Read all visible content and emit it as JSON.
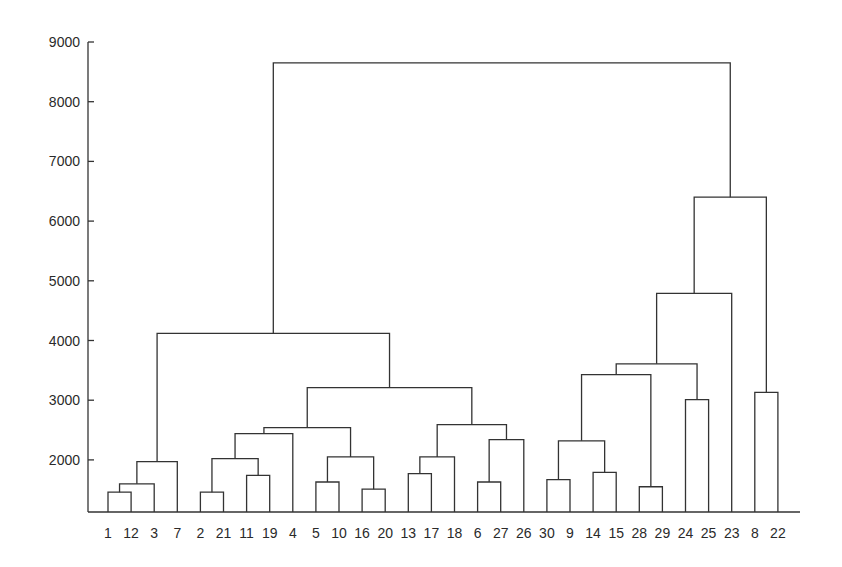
{
  "chart_data": {
    "type": "dendrogram",
    "title": "",
    "xlabel": "",
    "ylabel": "",
    "ylim": [
      1110,
      9000
    ],
    "y_ticks": [
      2000,
      3000,
      4000,
      5000,
      6000,
      7000,
      8000,
      9000
    ],
    "grid": false,
    "leaf_order": [
      "1",
      "12",
      "3",
      "7",
      "2",
      "21",
      "11",
      "19",
      "4",
      "5",
      "10",
      "16",
      "20",
      "13",
      "17",
      "18",
      "6",
      "27",
      "26",
      "30",
      "9",
      "14",
      "15",
      "28",
      "29",
      "24",
      "25",
      "23",
      "8",
      "22"
    ],
    "merges": [
      {
        "id": "A",
        "left": "1",
        "right": "12",
        "height": 1460
      },
      {
        "id": "B",
        "left": "A",
        "right": "3",
        "height": 1600
      },
      {
        "id": "C",
        "left": "B",
        "right": "7",
        "height": 1970
      },
      {
        "id": "D",
        "left": "2",
        "right": "21",
        "height": 1460
      },
      {
        "id": "E",
        "left": "11",
        "right": "19",
        "height": 1740
      },
      {
        "id": "F",
        "left": "D",
        "right": "E",
        "height": 2020
      },
      {
        "id": "G",
        "left": "F",
        "right": "4",
        "height": 2440
      },
      {
        "id": "H",
        "left": "5",
        "right": "10",
        "height": 1630
      },
      {
        "id": "I",
        "left": "16",
        "right": "20",
        "height": 1510
      },
      {
        "id": "J",
        "left": "H",
        "right": "I",
        "height": 2050
      },
      {
        "id": "K",
        "left": "G",
        "right": "J",
        "height": 2540
      },
      {
        "id": "L",
        "left": "13",
        "right": "17",
        "height": 1770
      },
      {
        "id": "M",
        "left": "L",
        "right": "18",
        "height": 2050
      },
      {
        "id": "N",
        "left": "6",
        "right": "27",
        "height": 1630
      },
      {
        "id": "O",
        "left": "N",
        "right": "26",
        "height": 2340
      },
      {
        "id": "P",
        "left": "M",
        "right": "O",
        "height": 2590
      },
      {
        "id": "Q",
        "left": "K",
        "right": "P",
        "height": 3210
      },
      {
        "id": "R",
        "left": "C",
        "right": "Q",
        "height": 4120
      },
      {
        "id": "S",
        "left": "30",
        "right": "9",
        "height": 1670
      },
      {
        "id": "T",
        "left": "14",
        "right": "15",
        "height": 1790
      },
      {
        "id": "U",
        "left": "S",
        "right": "T",
        "height": 2320
      },
      {
        "id": "V",
        "left": "28",
        "right": "29",
        "height": 1550
      },
      {
        "id": "W",
        "left": "U",
        "right": "V",
        "height": 3430
      },
      {
        "id": "X",
        "left": "24",
        "right": "25",
        "height": 3010
      },
      {
        "id": "Y",
        "left": "W",
        "right": "X",
        "height": 3610
      },
      {
        "id": "Z",
        "left": "Y",
        "right": "23",
        "height": 4790
      },
      {
        "id": "AA",
        "left": "8",
        "right": "22",
        "height": 3130
      },
      {
        "id": "AB",
        "left": "Z",
        "right": "AA",
        "height": 6400
      },
      {
        "id": "ROOT",
        "left": "R",
        "right": "AB",
        "height": 8650
      }
    ]
  },
  "axis": {
    "tick_labels": [
      "9000",
      "8000",
      "7000",
      "6000",
      "5000",
      "4000",
      "3000",
      "2000"
    ]
  },
  "colors": {
    "line": "#333333",
    "text": "#2a2a2a",
    "background": "#ffffff"
  }
}
